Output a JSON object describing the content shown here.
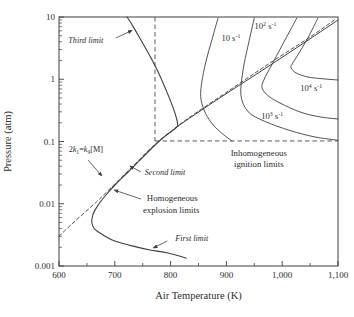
{
  "figure": {
    "background_color": "#ffffff",
    "line_color": "#3f3f3f",
    "text_color": "#2d2d2d"
  },
  "chart_data": {
    "type": "line",
    "title": "",
    "xlabel": "Air Temperature (K)",
    "ylabel": "Pressure (atm)",
    "grid": false,
    "x_axis": {
      "scale": "linear",
      "min": 600,
      "max": 1100,
      "major_ticks": [
        {
          "v": 600,
          "label": "600"
        },
        {
          "v": 700,
          "label": "700"
        },
        {
          "v": 800,
          "label": "800"
        },
        {
          "v": 900,
          "label": "900"
        },
        {
          "v": 1000,
          "label": "1,000"
        },
        {
          "v": 1100,
          "label": "1,100"
        }
      ],
      "minor_ticks": [
        650,
        750,
        850,
        950,
        1050
      ]
    },
    "y_axis": {
      "scale": "log",
      "min": 0.001,
      "max": 10,
      "major_ticks": [
        {
          "v": 10,
          "label": "10"
        },
        {
          "v": 1,
          "label": "1"
        },
        {
          "v": 0.1,
          "label": "0.1"
        },
        {
          "v": 0.01,
          "label": "0.01"
        },
        {
          "v": 0.001,
          "label": "0.001"
        }
      ]
    },
    "series": [
      {
        "name": "homogeneous-explosion-limit-first-second",
        "style": "solid",
        "width": 1.1,
        "points": [
          [
            828,
            0.00134
          ],
          [
            795,
            0.00162
          ],
          [
            763,
            0.00181
          ],
          [
            731,
            0.0021
          ],
          [
            700,
            0.00252
          ],
          [
            679,
            0.00315
          ],
          [
            664,
            0.0039
          ],
          [
            659,
            0.0049
          ],
          [
            661,
            0.0068
          ],
          [
            670,
            0.0095
          ],
          [
            684,
            0.0138
          ],
          [
            702,
            0.0208
          ],
          [
            722,
            0.0312
          ],
          [
            742,
            0.047
          ],
          [
            763,
            0.073
          ],
          [
            786,
            0.114
          ],
          [
            803,
            0.148
          ],
          [
            813,
            0.177
          ]
        ]
      },
      {
        "name": "third-limit",
        "style": "solid",
        "width": 1.1,
        "points": [
          [
            813,
            0.177
          ],
          [
            811,
            0.23
          ],
          [
            804,
            0.36
          ],
          [
            792,
            0.67
          ],
          [
            776,
            1.41
          ],
          [
            758,
            2.84
          ],
          [
            742,
            5.1
          ],
          [
            729,
            8.0
          ],
          [
            722,
            10
          ]
        ]
      },
      {
        "name": "second-limit-extension",
        "style": "solid",
        "width": 1.0,
        "points": [
          [
            813,
            0.177
          ],
          [
            885,
            0.48
          ],
          [
            957,
            1.26
          ],
          [
            1028,
            3.3
          ],
          [
            1100,
            8.95
          ]
        ]
      },
      {
        "name": "crossover-line-2k1-k9M",
        "style": "dashed",
        "width": 0.9,
        "points": [
          [
            600,
            0.003
          ],
          [
            629,
            0.0053
          ],
          [
            665,
            0.0103
          ],
          [
            700,
            0.0208
          ],
          [
            736,
            0.0435
          ],
          [
            767,
            0.082
          ],
          [
            799,
            0.142
          ],
          [
            835,
            0.248
          ],
          [
            906,
            0.67
          ],
          [
            978,
            1.82
          ],
          [
            1050,
            4.77
          ],
          [
            1096,
            9.3
          ]
        ]
      },
      {
        "name": "strain-rate-contour-10",
        "style": "solid",
        "width": 0.9,
        "points": [
          [
            885,
            9.6
          ],
          [
            874,
            4.27
          ],
          [
            863,
            1.89
          ],
          [
            856,
            0.9
          ],
          [
            854,
            0.52
          ],
          [
            860,
            0.32
          ],
          [
            872,
            0.206
          ],
          [
            889,
            0.142
          ],
          [
            910,
            0.102
          ]
        ]
      },
      {
        "name": "strain-rate-contour-100",
        "style": "solid",
        "width": 0.9,
        "points": [
          [
            950,
            9.6
          ],
          [
            939,
            3.55
          ],
          [
            930,
            1.41
          ],
          [
            926,
            0.56
          ],
          [
            939,
            0.3
          ],
          [
            969,
            0.21
          ],
          [
            1014,
            0.15
          ],
          [
            1059,
            0.118
          ],
          [
            1100,
            0.105
          ]
        ]
      },
      {
        "name": "strain-rate-contour-1000",
        "style": "solid",
        "width": 0.9,
        "points": [
          [
            1026,
            9.6
          ],
          [
            1005,
            4.27
          ],
          [
            984,
            1.89
          ],
          [
            967,
            0.97
          ],
          [
            964,
            0.72
          ],
          [
            975,
            0.54
          ],
          [
            996,
            0.415
          ],
          [
            1032,
            0.298
          ],
          [
            1068,
            0.248
          ],
          [
            1100,
            0.23
          ]
        ]
      },
      {
        "name": "strain-rate-contour-10000",
        "style": "solid",
        "width": 0.9,
        "points": [
          [
            1064,
            9.6
          ],
          [
            1046,
            4.6
          ],
          [
            1028,
            2.45
          ],
          [
            1018,
            1.76
          ],
          [
            1016,
            1.52
          ],
          [
            1025,
            1.26
          ],
          [
            1046,
            1.087
          ],
          [
            1077,
            1.009
          ],
          [
            1100,
            0.973
          ]
        ]
      }
    ],
    "guides": [
      {
        "name": "inhomogeneous-region-vertical-guide",
        "type": "vline",
        "x": 772,
        "p_from": 10,
        "p_to": 0.102
      },
      {
        "name": "inhomogeneous-region-horizontal-guide",
        "type": "hline",
        "p": 0.102,
        "x_from": 772,
        "x_to": 1100
      }
    ],
    "annotations": [
      {
        "name": "third-limit-label",
        "t": 648,
        "p": 4.3,
        "italic": true,
        "size": 8.2,
        "segments": [
          {
            "t": "Third limit"
          }
        ]
      },
      {
        "name": "crossover-equation-label",
        "t": 648,
        "p": 0.076,
        "italic": false,
        "size": 8.2,
        "segments": [
          {
            "t": "2"
          },
          {
            "t": "k",
            "italic": true
          },
          {
            "t": "1",
            "sub": true
          },
          {
            "t": "="
          },
          {
            "t": "k",
            "italic": true
          },
          {
            "t": "9",
            "sub": true
          },
          {
            "t": "[M]"
          }
        ]
      },
      {
        "name": "second-limit-label",
        "t": 790,
        "p": 0.0324,
        "italic": true,
        "size": 8.2,
        "segments": [
          {
            "t": "Second limit"
          }
        ]
      },
      {
        "name": "homogeneous-label-line1",
        "t": 803,
        "p": 0.0124,
        "italic": false,
        "size": 8.8,
        "segments": [
          {
            "t": "Homogeneous"
          }
        ]
      },
      {
        "name": "homogeneous-label-line2",
        "t": 801,
        "p": 0.0079,
        "italic": false,
        "size": 8.8,
        "segments": [
          {
            "t": "explosion limits"
          }
        ]
      },
      {
        "name": "first-limit-label",
        "t": 838,
        "p": 0.0028,
        "italic": true,
        "size": 8.2,
        "segments": [
          {
            "t": "First limit"
          }
        ]
      },
      {
        "name": "inhomogeneous-label-line1",
        "t": 958,
        "p": 0.065,
        "italic": false,
        "size": 8.8,
        "segments": [
          {
            "t": "Inhomogeneous"
          }
        ]
      },
      {
        "name": "inhomogeneous-label-line2",
        "t": 958,
        "p": 0.0435,
        "italic": false,
        "size": 8.8,
        "segments": [
          {
            "t": "ignition limits"
          }
        ]
      },
      {
        "name": "rate-label-10",
        "t": 908,
        "p": 4.6,
        "italic": false,
        "size": 8.6,
        "segments": [
          {
            "t": "10 s"
          },
          {
            "t": "-1",
            "sup": true
          }
        ]
      },
      {
        "name": "rate-label-100",
        "t": 970,
        "p": 7.2,
        "italic": false,
        "size": 8.6,
        "segments": [
          {
            "t": "10"
          },
          {
            "t": "2",
            "sup": true
          },
          {
            "t": " s"
          },
          {
            "t": "-1",
            "sup": true
          }
        ]
      },
      {
        "name": "rate-label-10000",
        "t": 1052,
        "p": 0.72,
        "italic": false,
        "size": 8.6,
        "segments": [
          {
            "t": "10"
          },
          {
            "t": "4",
            "sup": true
          },
          {
            "t": " s"
          },
          {
            "t": "-1",
            "sup": true
          }
        ]
      },
      {
        "name": "rate-label-1000",
        "t": 982,
        "p": 0.26,
        "italic": false,
        "size": 8.6,
        "segments": [
          {
            "t": "10"
          },
          {
            "t": "3",
            "sup": true
          },
          {
            "t": " s"
          },
          {
            "t": "-1",
            "sup": true
          }
        ]
      }
    ],
    "arrows": [
      {
        "name": "third-limit-arrow",
        "from": [
          702,
          4.6
        ],
        "to": [
          731,
          6.1
        ]
      },
      {
        "name": "crossover-equation-arrow",
        "from": [
          652,
          0.0504
        ],
        "to": [
          677,
          0.0279
        ]
      },
      {
        "name": "second-limit-arrow",
        "from": [
          747,
          0.0324
        ],
        "to": [
          727,
          0.0404
        ]
      },
      {
        "name": "homogeneous-arrow",
        "from": [
          747,
          0.0119
        ],
        "to": [
          699,
          0.0166
        ]
      },
      {
        "name": "first-limit-arrow",
        "from": [
          794,
          0.00252
        ],
        "to": [
          769,
          0.00195
        ]
      }
    ]
  }
}
